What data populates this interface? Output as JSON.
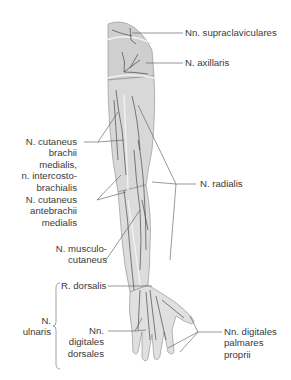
{
  "figure": {
    "colors": {
      "skin": "#d9d9d9",
      "skin_light": "#e6e6e6",
      "nerve": "#4a4a4a",
      "leader_line": "#555555",
      "text": "#3a3a3a",
      "background": "#ffffff"
    }
  },
  "labels": {
    "supraclaviculares": {
      "lines": [
        "Nn. supraclaviculares"
      ]
    },
    "axillaris": {
      "lines": [
        "N. axillaris"
      ]
    },
    "cut_brachii_medialis": {
      "lines": [
        "N. cutaneus",
        "brachii",
        "medialis,",
        "n. intercosto-",
        "brachialis"
      ]
    },
    "radialis": {
      "lines": [
        "N. radialis"
      ]
    },
    "cut_antebrachii_medialis": {
      "lines": [
        "N. cutaneus",
        "antebrachii",
        "medialis"
      ]
    },
    "musculocutaneus": {
      "lines": [
        "N. musculo-",
        "cutaneus"
      ]
    },
    "ulnaris_group": {
      "lines": [
        "N.",
        "ulnaris"
      ]
    },
    "r_dorsalis": {
      "lines": [
        "R. dorsalis"
      ]
    },
    "digitales_dorsales": {
      "lines": [
        "Nn.",
        "digitales",
        "dorsales"
      ]
    },
    "digitales_palmares_proprii": {
      "lines": [
        "Nn. digitales",
        "palmares",
        "proprii"
      ]
    }
  }
}
